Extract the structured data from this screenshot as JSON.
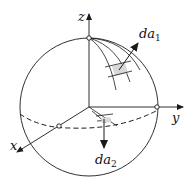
{
  "diagram": {
    "type": "sphere-coordinate-diagram",
    "axes": {
      "x_label": "x",
      "y_label": "y",
      "z_label": "z"
    },
    "vectors": {
      "da1": {
        "base": "da",
        "subscript": "1",
        "direction": "outward normal on sphere surface"
      },
      "da2": {
        "base": "da",
        "subscript": "2",
        "direction": "downward normal on equatorial plane"
      }
    },
    "colors": {
      "stroke": "#1a1a1a",
      "patch_fill": "#d9d9d9",
      "background": "#ffffff"
    }
  }
}
